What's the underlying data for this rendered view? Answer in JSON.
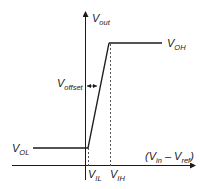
{
  "diagram": {
    "labels": {
      "y_axis": {
        "main": "V",
        "sub": "out"
      },
      "x_axis": {
        "open": "(V",
        "in_sub": "in",
        "minus": " – V",
        "ref_sub": "ref",
        "close": ")"
      },
      "v_oh": {
        "main": "V",
        "sub": "OH"
      },
      "v_ol": {
        "main": "V",
        "sub": "OL"
      },
      "v_il": {
        "main": "V",
        "sub": "IL"
      },
      "v_ih": {
        "main": "V",
        "sub": "IH"
      },
      "v_offset": {
        "main": "V",
        "sub": "offset"
      }
    },
    "colors": {
      "line": "#1a1a1a",
      "dashed": "#555555"
    }
  }
}
